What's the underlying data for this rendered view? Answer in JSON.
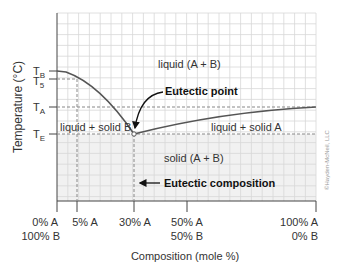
{
  "chart_data": {
    "type": "phase-diagram",
    "title": "",
    "xlabel": "Composition (mole %)",
    "ylabel": "Temperature (°C)",
    "y_ticks": [
      {
        "label": "T",
        "sub": "B",
        "id": "TB"
      },
      {
        "label": "T",
        "sub": "5",
        "id": "T5"
      },
      {
        "label": "T",
        "sub": "A",
        "id": "TA"
      },
      {
        "label": "T",
        "sub": "E",
        "id": "TE"
      }
    ],
    "x_ticks": [
      {
        "line1": "0% A",
        "line2": "100% B",
        "mole_pct_A": 0
      },
      {
        "line1": "5% A",
        "line2": "",
        "mole_pct_A": 5
      },
      {
        "line1": "30% A",
        "line2": "",
        "mole_pct_A": 30
      },
      {
        "line1": "50% A",
        "line2": "50% B",
        "mole_pct_A": 50
      },
      {
        "line1": "100% A",
        "line2": "0% B",
        "mole_pct_A": 100
      }
    ],
    "regions": {
      "liquid": "liquid (A + B)",
      "liquid_solid_b": "liquid + solid B",
      "liquid_solid_a": "liquid + solid A",
      "solid": "solid (A + B)"
    },
    "annotations": {
      "eutectic_point": "Eutectic point",
      "eutectic_composition": "Eutectic composition"
    },
    "eutectic": {
      "mole_pct_A": 30,
      "temperature": "TE"
    },
    "grid": true
  },
  "copyright": "©Hayden-McNeil, LLC"
}
